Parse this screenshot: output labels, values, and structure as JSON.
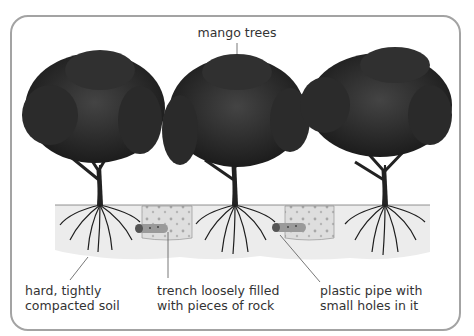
{
  "diagram": {
    "title": "mango trees",
    "labels": {
      "soil": [
        "hard, tightly",
        "compacted soil"
      ],
      "trench": [
        "trench loosely filled",
        "with pieces of rock"
      ],
      "pipe": [
        "plastic pipe with",
        "small holes in it"
      ]
    },
    "elements": {
      "trees": 3,
      "trenches": 2,
      "pipes": 2
    },
    "colors": {
      "frame_border": "#a3a3a3",
      "foliage": "#2a2a2a",
      "soil": "#ececec",
      "trench_fill": "#dcdcdc",
      "text": "#333333"
    }
  }
}
